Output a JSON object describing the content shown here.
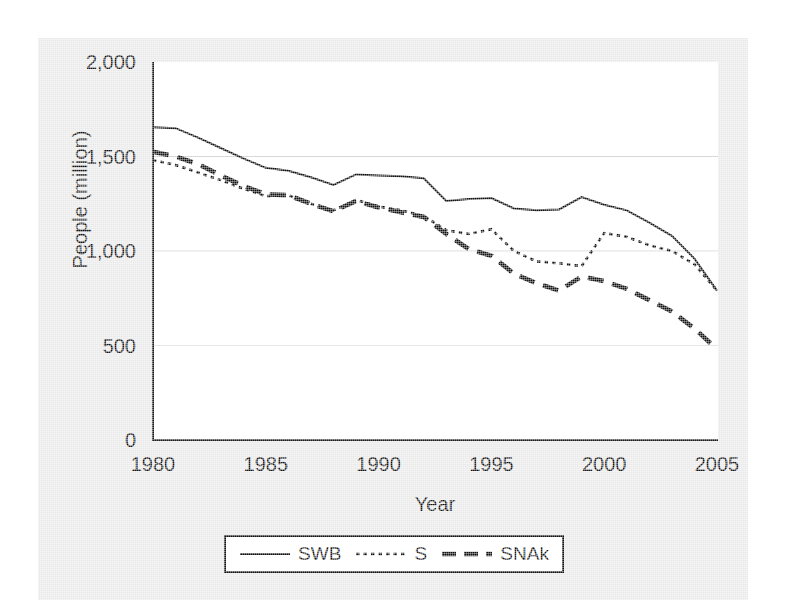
{
  "chart_data": {
    "type": "line",
    "title": "",
    "xlabel": "Year",
    "ylabel": "People (million)",
    "xlim": [
      1980,
      2005
    ],
    "ylim": [
      0,
      2000
    ],
    "grid": "horizontal",
    "legend_position": "bottom-center",
    "xticks": [
      "1980",
      "1985",
      "1990",
      "1995",
      "2000",
      "2005"
    ],
    "xtick_values": [
      1980,
      1985,
      1990,
      1995,
      2000,
      2005
    ],
    "yticks": [
      "0",
      "500",
      "1,000",
      "1,500",
      "2,000"
    ],
    "ytick_values": [
      0,
      500,
      1000,
      1500,
      2000
    ],
    "x": [
      1980,
      1981,
      1982,
      1983,
      1984,
      1985,
      1986,
      1987,
      1988,
      1989,
      1990,
      1991,
      1992,
      1993,
      1994,
      1995,
      1996,
      1997,
      1998,
      1999,
      2000,
      2001,
      2002,
      2003,
      2004,
      2005
    ],
    "series": [
      {
        "name": "SWB",
        "style": "solid",
        "color": "#111111",
        "values": [
          1655,
          1650,
          1600,
          1545,
          1490,
          1440,
          1425,
          1390,
          1350,
          1405,
          1400,
          1395,
          1385,
          1265,
          1275,
          1280,
          1225,
          1215,
          1220,
          1285,
          1245,
          1215,
          1150,
          1080,
          960,
          790
        ]
      },
      {
        "name": "S",
        "style": "dotted",
        "color": "#111111",
        "values": [
          1480,
          1455,
          1415,
          1375,
          1330,
          1290,
          1295,
          1250,
          1215,
          1270,
          1235,
          1215,
          1185,
          1110,
          1090,
          1115,
          1000,
          945,
          935,
          920,
          1095,
          1075,
          1030,
          1000,
          930,
          790
        ]
      },
      {
        "name": "SNAk",
        "style": "dashed",
        "color": "#111111",
        "values": [
          1525,
          1500,
          1460,
          1400,
          1345,
          1300,
          1295,
          1250,
          1210,
          1265,
          1230,
          1205,
          1180,
          1090,
          1010,
          975,
          880,
          830,
          790,
          865,
          840,
          800,
          740,
          680,
          590,
          480
        ]
      }
    ]
  },
  "legend": {
    "entries": [
      {
        "label": "SWB",
        "key": "solid-line-key"
      },
      {
        "label": "S",
        "key": "dotted-line-key"
      },
      {
        "label": "SNAk",
        "key": "dashed-line-key"
      }
    ]
  }
}
